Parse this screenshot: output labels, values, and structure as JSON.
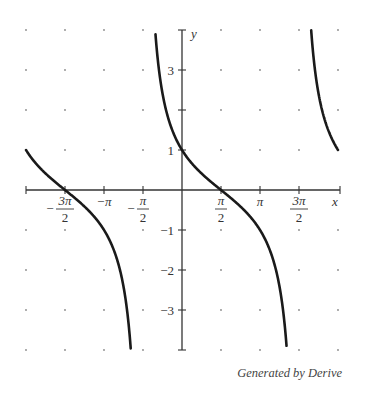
{
  "chart_data": {
    "type": "line",
    "title": "",
    "function": "y = tan(pi/4 - x/2)  (equivalently cot(x/2 + pi/4))",
    "xlabel": "x",
    "ylabel": "y",
    "xlim": [
      -6.2832,
      6.2832
    ],
    "ylim": [
      -4,
      4
    ],
    "grid": "dots",
    "x_ticks": [
      {
        "value": -4.7124,
        "label_num": "3π",
        "label_den": "2",
        "sign": "−"
      },
      {
        "value": -3.1416,
        "label": "−π"
      },
      {
        "value": -1.5708,
        "label_num": "π",
        "label_den": "2",
        "sign": "−"
      },
      {
        "value": 1.5708,
        "label_num": "π",
        "label_den": "2",
        "sign": ""
      },
      {
        "value": 3.1416,
        "label": "π"
      },
      {
        "value": 4.7124,
        "label_num": "3π",
        "label_den": "2",
        "sign": ""
      }
    ],
    "y_ticks": [
      {
        "value": 3,
        "label": "3"
      },
      {
        "value": 2,
        "label": ""
      },
      {
        "value": 1,
        "label": "1"
      },
      {
        "value": -1,
        "label": "−1"
      },
      {
        "value": -2,
        "label": "−2"
      },
      {
        "value": -3,
        "label": "−3"
      }
    ],
    "asymptotes": [
      -1.5708,
      4.7124
    ],
    "branches": [
      {
        "x_start": -6.2832,
        "x_end": -1.5708
      },
      {
        "x_start": -1.5708,
        "x_end": 4.7124
      },
      {
        "x_start": 4.7124,
        "x_end": 6.2832
      }
    ],
    "key_points": [
      {
        "x": -6.2832,
        "y": 1
      },
      {
        "x": -4.7124,
        "y": 0
      },
      {
        "x": 0,
        "y": 1
      },
      {
        "x": 1.5708,
        "y": 0
      },
      {
        "x": 6.2832,
        "y": 1
      }
    ],
    "legend": null
  },
  "labels": {
    "x_axis": "x",
    "y_axis": "y",
    "caption": "Generated by Derive"
  },
  "style": {
    "curve_color": "#1a1a1a",
    "axis_color": "#333333",
    "dot_color": "#888888"
  }
}
